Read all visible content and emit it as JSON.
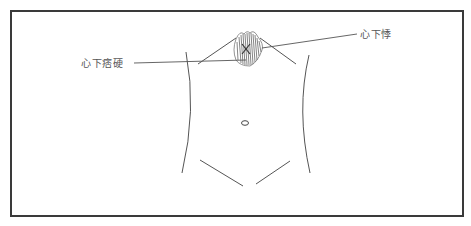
{
  "figure": {
    "type": "abdominal-diagram",
    "labels": {
      "left": "心下痞硬",
      "right": "心下悸"
    },
    "colors": {
      "frame": "#3a3a3a",
      "lines": "#555555",
      "hatch": "#666666",
      "background": "#ffffff"
    }
  }
}
